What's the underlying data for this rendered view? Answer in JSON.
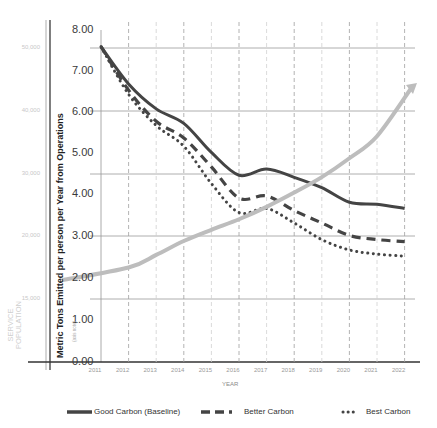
{
  "chart_data": {
    "type": "line",
    "title": "",
    "xlabel": "YEAR",
    "ylabel": "Metric Tons Emitted per person per Year from Operations",
    "secondary_ylabel": "SERVICE POPULATION",
    "axis_note": "(axis note)",
    "ylim": [
      0,
      8
    ],
    "x": [
      2011,
      2012,
      2013,
      2014,
      2015,
      2016,
      2017,
      2018,
      2019,
      2020,
      2021,
      2022
    ],
    "y_ticks": [
      "8.00",
      "7.00",
      "6.00",
      "5.00",
      "4.00",
      "3.00",
      "2.00",
      "1.00",
      "0.00"
    ],
    "secondary_y_ticks": [
      "50,000",
      "40,000",
      "30,000",
      "20,000",
      "15,000"
    ],
    "grid": {
      "horizontal": "solid",
      "vertical": "dashed"
    },
    "legend_position": "bottom",
    "series": [
      {
        "name": "Good Carbon (Baseline)",
        "style": "solid",
        "color": "#444444",
        "values": [
          7.6,
          6.7,
          6.1,
          5.75,
          5.05,
          4.5,
          4.65,
          4.45,
          4.2,
          3.85,
          3.8,
          3.7
        ]
      },
      {
        "name": "Better Carbon",
        "style": "dashed",
        "color": "#444444",
        "values": [
          7.6,
          6.55,
          5.8,
          5.4,
          4.7,
          3.95,
          4.0,
          3.65,
          3.35,
          3.05,
          2.95,
          2.9
        ]
      },
      {
        "name": "Best Carbon",
        "style": "dotted",
        "color": "#444444",
        "values": [
          7.6,
          6.45,
          5.7,
          5.2,
          4.3,
          3.6,
          3.7,
          3.35,
          2.95,
          2.7,
          2.6,
          2.55
        ]
      },
      {
        "name": "Service Population",
        "style": "solid-arrow",
        "color": "#bdbdbd",
        "axis": "secondary",
        "values": [
          16500,
          17500,
          18500,
          19600,
          21000,
          22700,
          24700,
          27000,
          29500,
          32500,
          36000,
          40000
        ]
      }
    ]
  },
  "labels": {
    "x_title": "YEAR",
    "y_title": "Metric Tons Emitted per person per Year from Operations",
    "pop_title_line1": "SERVICE",
    "pop_title_line2": "POPULATION",
    "axis_note": "(axis note)",
    "y_ticks": [
      "8.00",
      "7.00",
      "6.00",
      "5.00",
      "4.00",
      "3.00",
      "2.00",
      "1.00",
      "0.00"
    ],
    "pop_ticks": [
      "50,000",
      "40,000",
      "30,000",
      "20,000",
      "15,000"
    ],
    "x_ticks": [
      "2011",
      "2012",
      "2013",
      "2014",
      "2015",
      "2016",
      "2017",
      "2018",
      "2019",
      "2020",
      "2021",
      "2022"
    ]
  },
  "legend": [
    {
      "label": "Good Carbon (Baseline)"
    },
    {
      "label": "Better Carbon"
    },
    {
      "label": "Best Carbon"
    }
  ]
}
